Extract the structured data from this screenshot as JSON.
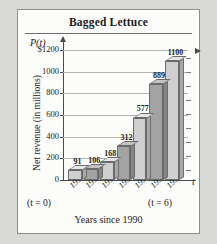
{
  "panel": {
    "title": "Bagged Lettuce"
  },
  "axis": {
    "y_axis_symbol": "P(t)",
    "x_axis_symbol": "t",
    "ylabel": "Net revenue (in millions)",
    "xlabel": "Years since 1990",
    "t_start_note": "(t = 0)",
    "t_end_note": "(t = 6)"
  },
  "chart_data": {
    "type": "bar",
    "title": "Bagged Lettuce",
    "xlabel": "Years since 1990",
    "ylabel": "Net revenue (in millions)",
    "categories": [
      "1990",
      "1991",
      "1992",
      "1993",
      "1994",
      "1995",
      "1996"
    ],
    "values": [
      91,
      106,
      168,
      312,
      577,
      889,
      1100
    ],
    "value_labels": [
      "91",
      "106",
      "168",
      "312",
      "577",
      "889",
      "1100"
    ],
    "t_values": [
      0,
      1,
      2,
      3,
      4,
      5,
      6
    ],
    "ylim": [
      0,
      1200
    ],
    "ytick_values": [
      0,
      200,
      400,
      600,
      800,
      1000,
      1200
    ],
    "ytick_labels": [
      "0",
      "200",
      "400",
      "600",
      "800",
      "1000",
      "$1200"
    ],
    "grid": true,
    "legend": "none",
    "bar_shading": [
      "light",
      "dark",
      "light",
      "dark",
      "light",
      "dark",
      "light"
    ],
    "style": "3d-bars-grayscale",
    "annotations": [
      "(t = 0)",
      "(t = 6)"
    ]
  },
  "colors": {
    "page_background": "#d9d9d6",
    "panel_background": "#fcfcfa",
    "panel_border": "#8d8d8d",
    "axis": "#4a4a4a",
    "gridline": "#b4b4b4",
    "bar_light_front": "#cfcfcf",
    "bar_dark_front": "#a3a3a3",
    "text": "#1b1b1b"
  }
}
